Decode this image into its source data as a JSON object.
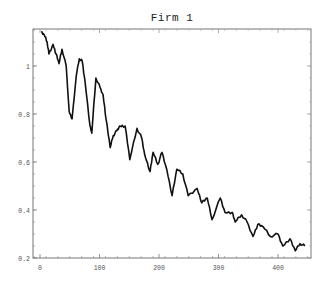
{
  "chart_data": {
    "type": "line",
    "title": "Firm 1",
    "xlabel": "",
    "ylabel": "",
    "xlim": [
      -12,
      455
    ],
    "ylim": [
      0.2,
      1.16
    ],
    "xticks": [
      0,
      100,
      200,
      300,
      400
    ],
    "xtick_labels": [
      "0",
      "100",
      "200",
      "300",
      "400"
    ],
    "yticks": [
      0.2,
      0.4,
      0.6,
      0.8,
      1.0
    ],
    "ytick_labels": [
      "0.2",
      "0.4",
      "0.6",
      "0.8",
      "1"
    ],
    "grid": false,
    "legend": null,
    "series": [
      {
        "name": "Firm 1",
        "color": "#111111",
        "x": [
          2,
          7,
          12,
          15,
          22,
          27,
          32,
          37,
          44,
          49,
          54,
          61,
          66,
          71,
          76,
          84,
          87,
          94,
          101,
          106,
          111,
          118,
          123,
          129,
          134,
          143,
          151,
          163,
          171,
          176,
          185,
          190,
          198,
          205,
          213,
          222,
          230,
          240,
          249,
          264,
          272,
          281,
          289,
          303,
          311,
          323,
          328,
          339,
          348,
          358,
          366,
          375,
          387,
          400,
          408,
          420,
          429,
          437,
          445
        ],
        "values": [
          1.14,
          1.13,
          1.1,
          1.05,
          1.09,
          1.05,
          1.01,
          1.07,
          1.0,
          0.81,
          0.78,
          0.96,
          1.03,
          1.02,
          0.93,
          0.75,
          0.72,
          0.95,
          0.91,
          0.88,
          0.78,
          0.66,
          0.71,
          0.73,
          0.75,
          0.75,
          0.61,
          0.74,
          0.7,
          0.63,
          0.56,
          0.64,
          0.59,
          0.64,
          0.57,
          0.46,
          0.57,
          0.55,
          0.46,
          0.49,
          0.43,
          0.45,
          0.36,
          0.45,
          0.39,
          0.39,
          0.35,
          0.38,
          0.35,
          0.29,
          0.34,
          0.33,
          0.29,
          0.3,
          0.25,
          0.28,
          0.23,
          0.26,
          0.25
        ]
      }
    ]
  },
  "frame": {
    "left": 33,
    "top": 29,
    "right": 311,
    "bottom": 258
  },
  "axis_map": {
    "x0_px": 40,
    "x_px_per_unit": 0.595,
    "y02_px": 258,
    "y_px_per_unit": 240
  }
}
